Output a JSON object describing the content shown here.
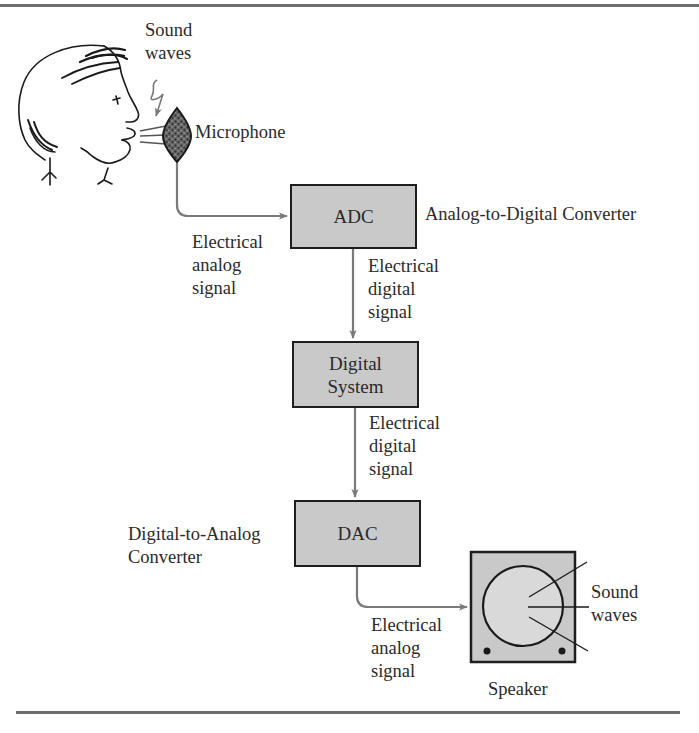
{
  "diagram": {
    "type": "block-diagram",
    "title": "",
    "colors": {
      "block_fill": "#c9c9c9",
      "block_border": "#1e1e1e",
      "arrow": "#7a7a7a",
      "rule": "#6e6e6e"
    },
    "source": {
      "person_label": "",
      "sound_waves_label": [
        "Sound",
        "waves"
      ],
      "microphone_label": "Microphone"
    },
    "blocks": [
      {
        "id": "adc",
        "label": [
          "ADC"
        ],
        "description": "Analog-to-Digital Converter"
      },
      {
        "id": "digital_system",
        "label": [
          "Digital",
          "System"
        ]
      },
      {
        "id": "dac",
        "label": [
          "DAC"
        ],
        "description": [
          "Digital-to-Analog",
          "Converter"
        ]
      }
    ],
    "signals": [
      {
        "from": "microphone",
        "to": "adc",
        "label": [
          "Electrical",
          "analog",
          "signal"
        ]
      },
      {
        "from": "adc",
        "to": "digital_system",
        "label": [
          "Electrical",
          "digital",
          "signal"
        ]
      },
      {
        "from": "digital_system",
        "to": "dac",
        "label": [
          "Electrical",
          "digital",
          "signal"
        ]
      },
      {
        "from": "dac",
        "to": "speaker",
        "label": [
          "Electrical",
          "analog",
          "signal"
        ]
      }
    ],
    "output": {
      "speaker_label": "Speaker",
      "sound_waves_label": [
        "Sound",
        "waves"
      ]
    }
  }
}
